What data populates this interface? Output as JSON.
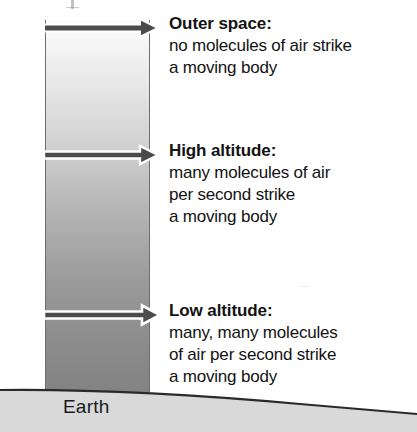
{
  "figure": {
    "type": "science-diagram",
    "background_color": "#ffffff"
  },
  "column": {
    "name": "atmosphere-column",
    "gradient_top_color": "#fdfdfd",
    "gradient_bottom_color": "#838383",
    "border_color": "#6d6d6d"
  },
  "ground": {
    "label": "Earth",
    "fill_color": "#d9d9d9",
    "outline_color": "#2a2a2a"
  },
  "arrows": [
    {
      "name": "arrow-outer-space",
      "fill_color": "#4b4b4b",
      "outline_color": "#ffffff",
      "direction": "right"
    },
    {
      "name": "arrow-high-altitude",
      "fill_color": "#4b4b4b",
      "outline_color": "#ffffff",
      "direction": "right"
    },
    {
      "name": "arrow-low-altitude",
      "fill_color": "#4b4b4b",
      "outline_color": "#ffffff",
      "direction": "right"
    }
  ],
  "callouts": [
    {
      "heading": "Outer space:",
      "lines": [
        "no molecules of air strike",
        "a moving body"
      ]
    },
    {
      "heading": "High altitude:",
      "lines": [
        "many molecules of air",
        "per second strike",
        "a moving body"
      ]
    },
    {
      "heading": "Low altitude:",
      "lines": [
        "many, many molecules",
        "of air per second strike",
        "a moving body"
      ]
    }
  ]
}
